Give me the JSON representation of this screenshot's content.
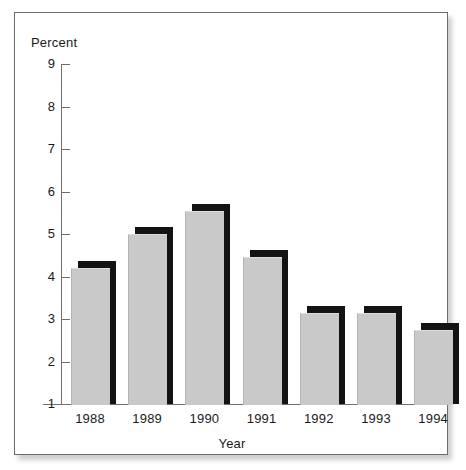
{
  "figure": {
    "background_color": "#ffffff",
    "frame_border_color": "#6d6d6d",
    "bar_fill_color": "#c9c9c9",
    "bar_shadow_color": "#131313",
    "axis_color": "#6f6f6f"
  },
  "chart_data": {
    "type": "bar",
    "title": "",
    "xlabel": "Year",
    "ylabel": "Percent",
    "categories": [
      "1988",
      "1989",
      "1990",
      "1991",
      "1992",
      "1993",
      "1994"
    ],
    "values": [
      4.2,
      5.0,
      5.55,
      4.45,
      3.15,
      3.15,
      2.75
    ],
    "ylim": [
      1,
      9
    ],
    "yticks": [
      1,
      2,
      3,
      4,
      5,
      6,
      7,
      8,
      9
    ],
    "ytick_labels": [
      "1",
      "2",
      "3",
      "4",
      "5",
      "6",
      "7",
      "8",
      "9"
    ],
    "grid": false,
    "legend": null,
    "legend_position": "none",
    "annotations": []
  }
}
